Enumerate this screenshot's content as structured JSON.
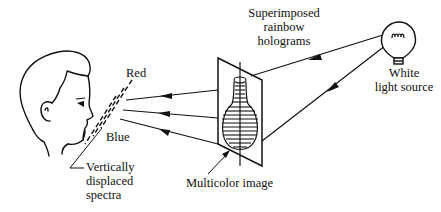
{
  "diagram": {
    "type": "optical-setup",
    "labels": {
      "hologram": [
        "Superimposed",
        "rainbow",
        "holograms"
      ],
      "light_source": [
        "White",
        "light source"
      ],
      "red": "Red",
      "blue": "Blue",
      "spectra": [
        "Vertically",
        "displaced",
        "spectra"
      ],
      "image": "Multicolor image"
    },
    "elements": [
      {
        "id": "viewer",
        "kind": "human-head-profile"
      },
      {
        "id": "spectra",
        "kind": "dashed-slit-lines"
      },
      {
        "id": "hologram-plate",
        "kind": "tilted-plate"
      },
      {
        "id": "vase-image",
        "kind": "multicolor-image"
      },
      {
        "id": "bulb",
        "kind": "light-bulb"
      }
    ],
    "connections": [
      {
        "from": "bulb",
        "to": "hologram-plate",
        "label": "illumination (upper)"
      },
      {
        "from": "bulb",
        "to": "hologram-plate",
        "label": "illumination (lower)"
      },
      {
        "from": "hologram-plate",
        "to": "spectra",
        "label": "red diffracted ray"
      },
      {
        "from": "hologram-plate",
        "to": "spectra",
        "label": "middle diffracted ray"
      },
      {
        "from": "hologram-plate",
        "to": "spectra",
        "label": "blue diffracted ray"
      }
    ],
    "colors": {
      "ink": "#111111",
      "background": "#ffffff"
    }
  }
}
